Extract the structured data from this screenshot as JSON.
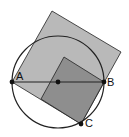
{
  "diagram": {
    "colors": {
      "background": "#ffffff",
      "large_square": "#b9b9b9",
      "small_square": "#8e8e8e",
      "stroke": "#222222",
      "point": "#111111"
    },
    "circle": {
      "cx": 58,
      "cy": 82,
      "r": 46
    },
    "large_square": {
      "points": "12,82 52,11 121,52 81,124"
    },
    "small_square": {
      "points": "64,57 104,82 81,124 41,99"
    },
    "segment_AB": {
      "x1": 12,
      "y1": 82,
      "x2": 104,
      "y2": 82
    },
    "points": [
      {
        "id": "A",
        "label": "A",
        "x": 12,
        "y": 82,
        "lx": 16,
        "ly": 80
      },
      {
        "id": "O",
        "label": "",
        "x": 58,
        "y": 82,
        "lx": 0,
        "ly": 0
      },
      {
        "id": "B",
        "label": "B",
        "x": 104,
        "y": 82,
        "lx": 107,
        "ly": 86
      },
      {
        "id": "C",
        "label": "C",
        "x": 81,
        "y": 124,
        "lx": 85,
        "ly": 127
      }
    ]
  }
}
